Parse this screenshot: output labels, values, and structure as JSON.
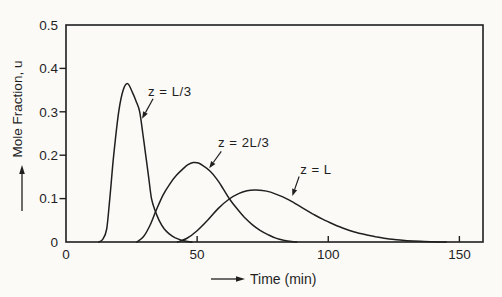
{
  "figure": {
    "ink_color": "#1f1f1f",
    "paper_color": "#fbfaf7"
  },
  "chart_data": {
    "type": "line",
    "title": "",
    "xlabel": "Time (min)",
    "ylabel": "Mole Fraction, u",
    "xlim": [
      0,
      159
    ],
    "ylim": [
      0,
      0.5
    ],
    "x_ticks": [
      50,
      100,
      150
    ],
    "x_tick_labels_all": [
      {
        "value": 0,
        "label": "0"
      },
      {
        "value": 50,
        "label": "50"
      },
      {
        "value": 100,
        "label": "100"
      },
      {
        "value": 150,
        "label": "150"
      }
    ],
    "y_ticks": [
      0.1,
      0.2,
      0.3,
      0.4
    ],
    "y_tick_labels_all": [
      {
        "value": 0,
        "label": "0"
      },
      {
        "value": 0.1,
        "label": "0.1"
      },
      {
        "value": 0.2,
        "label": "0.2"
      },
      {
        "value": 0.3,
        "label": "0.3"
      },
      {
        "value": 0.4,
        "label": "0.4"
      },
      {
        "value": 0.5,
        "label": "0.5"
      }
    ],
    "grid": false,
    "legend_position": "none",
    "series": [
      {
        "name": "z = L/3",
        "peak": {
          "t": 23.5,
          "u": 0.365
        },
        "points": [
          [
            12.5,
            0
          ],
          [
            14,
            0.006
          ],
          [
            15.5,
            0.03
          ],
          [
            16.7,
            0.1
          ],
          [
            18.2,
            0.2
          ],
          [
            20.1,
            0.3
          ],
          [
            21.8,
            0.35
          ],
          [
            23.5,
            0.365
          ],
          [
            25.3,
            0.345
          ],
          [
            26.7,
            0.325
          ],
          [
            28.1,
            0.3
          ],
          [
            29.3,
            0.25
          ],
          [
            30.4,
            0.2
          ],
          [
            31.5,
            0.15
          ],
          [
            32.6,
            0.1
          ],
          [
            34,
            0.072
          ],
          [
            35.5,
            0.05
          ],
          [
            37.5,
            0.03
          ],
          [
            39.5,
            0.018
          ],
          [
            41.5,
            0.01
          ],
          [
            44,
            0.004
          ],
          [
            46.5,
            0.001
          ],
          [
            48,
            0
          ]
        ]
      },
      {
        "name": "z = 2L/3",
        "peak": {
          "t": 48.5,
          "u": 0.183
        },
        "points": [
          [
            27,
            0
          ],
          [
            29.5,
            0.012
          ],
          [
            32,
            0.038
          ],
          [
            34.5,
            0.075
          ],
          [
            37,
            0.108
          ],
          [
            39.5,
            0.133
          ],
          [
            42,
            0.153
          ],
          [
            44.5,
            0.168
          ],
          [
            46.5,
            0.178
          ],
          [
            48.5,
            0.183
          ],
          [
            50.5,
            0.182
          ],
          [
            52.5,
            0.175
          ],
          [
            55,
            0.163
          ],
          [
            57.5,
            0.145
          ],
          [
            60,
            0.122
          ],
          [
            62.5,
            0.098
          ],
          [
            65,
            0.078
          ],
          [
            68,
            0.057
          ],
          [
            71,
            0.04
          ],
          [
            74,
            0.027
          ],
          [
            77,
            0.017
          ],
          [
            80,
            0.009
          ],
          [
            83,
            0.004
          ],
          [
            86,
            0.001
          ],
          [
            88,
            0
          ]
        ]
      },
      {
        "name": "z = L",
        "peak": {
          "t": 72,
          "u": 0.12
        },
        "points": [
          [
            42.5,
            0
          ],
          [
            46,
            0.008
          ],
          [
            50,
            0.026
          ],
          [
            54,
            0.05
          ],
          [
            58,
            0.077
          ],
          [
            62,
            0.098
          ],
          [
            66,
            0.112
          ],
          [
            69,
            0.118
          ],
          [
            72,
            0.12
          ],
          [
            75,
            0.119
          ],
          [
            78,
            0.115
          ],
          [
            81,
            0.108
          ],
          [
            84,
            0.1
          ],
          [
            87,
            0.09
          ],
          [
            90,
            0.079
          ],
          [
            94,
            0.065
          ],
          [
            98,
            0.052
          ],
          [
            102,
            0.041
          ],
          [
            106,
            0.031
          ],
          [
            110,
            0.023
          ],
          [
            114,
            0.017
          ],
          [
            118,
            0.012
          ],
          [
            122,
            0.008
          ],
          [
            126,
            0.005
          ],
          [
            130,
            0.003
          ],
          [
            135,
            0.0015
          ],
          [
            140,
            0.0005
          ],
          [
            145,
            0
          ]
        ]
      }
    ],
    "annotations": [
      {
        "text": "z = L/3",
        "text_at": [
          31.3,
          0.337
        ],
        "arrow_from": [
          33.2,
          0.33
        ],
        "arrow_to": [
          29.0,
          0.284
        ]
      },
      {
        "text": "z = 2L/3",
        "text_at": [
          58.0,
          0.218
        ],
        "arrow_from": [
          59.2,
          0.209
        ],
        "arrow_to": [
          54.6,
          0.17
        ]
      },
      {
        "text": "z = L",
        "text_at": [
          89.3,
          0.156
        ],
        "arrow_from": [
          88.9,
          0.151
        ],
        "arrow_to": [
          86.3,
          0.106
        ]
      }
    ]
  }
}
